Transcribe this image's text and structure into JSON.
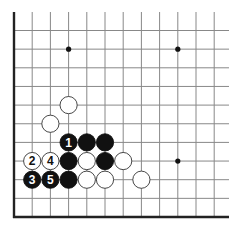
{
  "diagram": {
    "type": "go-board-corner",
    "grid": {
      "x0": 14,
      "dx": 18.2,
      "cols": 12,
      "y_bottom": 217,
      "dy": 18.65,
      "rows": 11,
      "edges": [
        "left",
        "bottom"
      ],
      "line_color": "#888888",
      "edge_color": "#222222"
    },
    "star_points": [
      {
        "col": 3,
        "row": 9
      },
      {
        "col": 9,
        "row": 9
      },
      {
        "col": 9,
        "row": 3
      }
    ],
    "stones": [
      {
        "color": "white",
        "col": 3,
        "row": 6,
        "label": ""
      },
      {
        "color": "white",
        "col": 2,
        "row": 5,
        "label": ""
      },
      {
        "color": "black",
        "col": 3,
        "row": 4,
        "label": "1"
      },
      {
        "color": "black",
        "col": 4,
        "row": 4,
        "label": ""
      },
      {
        "color": "black",
        "col": 5,
        "row": 4,
        "label": ""
      },
      {
        "color": "white",
        "col": 1,
        "row": 3,
        "label": "2"
      },
      {
        "color": "white",
        "col": 2,
        "row": 3,
        "label": "4"
      },
      {
        "color": "black",
        "col": 3,
        "row": 3,
        "label": ""
      },
      {
        "color": "white",
        "col": 4,
        "row": 3,
        "label": ""
      },
      {
        "color": "black",
        "col": 5,
        "row": 3,
        "label": ""
      },
      {
        "color": "white",
        "col": 6,
        "row": 3,
        "label": ""
      },
      {
        "color": "black",
        "col": 1,
        "row": 2,
        "label": "3"
      },
      {
        "color": "black",
        "col": 2,
        "row": 2,
        "label": "5"
      },
      {
        "color": "black",
        "col": 3,
        "row": 2,
        "label": ""
      },
      {
        "color": "white",
        "col": 4,
        "row": 2,
        "label": ""
      },
      {
        "color": "white",
        "col": 5,
        "row": 2,
        "label": ""
      },
      {
        "color": "white",
        "col": 7,
        "row": 2,
        "label": ""
      }
    ]
  }
}
